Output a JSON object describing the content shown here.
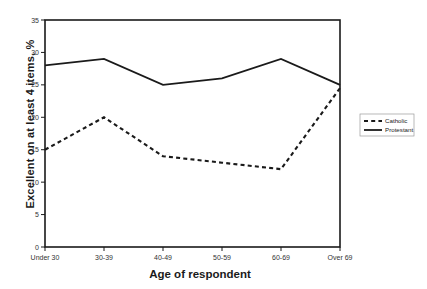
{
  "chart_data": {
    "type": "line",
    "title": "",
    "xlabel": "Age of respondent",
    "ylabel": "Excellent on at least 4 items, %",
    "categories": [
      "Under 30",
      "30-39",
      "40-49",
      "50-59",
      "60-69",
      "Over 69"
    ],
    "ylim": [
      0,
      35
    ],
    "yticks": [
      0,
      5,
      10,
      15,
      20,
      25,
      30,
      35
    ],
    "grid": false,
    "legend_position": "right",
    "series": [
      {
        "name": "Catholic",
        "style": "dashed",
        "color": "#1a1a1a",
        "values": [
          15,
          20,
          14,
          13,
          12,
          24.5
        ]
      },
      {
        "name": "Protestant",
        "style": "solid",
        "color": "#1a1a1a",
        "values": [
          28,
          29,
          25,
          26,
          29,
          25
        ]
      }
    ]
  },
  "axis": {
    "ytick_labels": [
      "0",
      "5",
      "10",
      "15",
      "20",
      "25",
      "30",
      "35"
    ],
    "xtick_labels": [
      "Under 30",
      "30-39",
      "40-49",
      "50-59",
      "60-69",
      "Over 69"
    ],
    "y_title": "Excellent on at least 4 items, %",
    "x_title": "Age of respondent"
  },
  "legend": {
    "items": [
      {
        "label": "Catholic",
        "style": "dashed"
      },
      {
        "label": "Protestant",
        "style": "solid"
      }
    ]
  }
}
